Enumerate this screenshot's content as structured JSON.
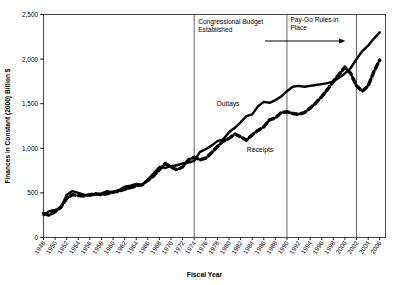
{
  "chart_data": {
    "type": "line",
    "title": "",
    "xlabel": "Fiscal Year",
    "ylabel": "Finances in Constant (2000) Billion $",
    "ylim": [
      0,
      2500
    ],
    "xlim": [
      1948,
      2007
    ],
    "yticks": [
      "0",
      "500",
      "1,000",
      "1,500",
      "2,000",
      "2,500"
    ],
    "ytick_values": [
      0,
      500,
      1000,
      1500,
      2000,
      2500
    ],
    "grid": false,
    "legend_position": "inline-labels",
    "xticks": [
      "1948",
      "1950",
      "1952",
      "1954",
      "1956",
      "1958",
      "1960",
      "1962",
      "1964",
      "1966",
      "1968",
      "1970",
      "1972",
      "1974",
      "1976",
      "1978",
      "1980",
      "1982",
      "1984",
      "1986",
      "1988",
      "1990",
      "1992",
      "1994",
      "1996",
      "1998",
      "2000",
      "2002",
      "2004",
      "2006"
    ],
    "xtick_values": [
      1948,
      1950,
      1952,
      1954,
      1956,
      1958,
      1960,
      1962,
      1964,
      1966,
      1968,
      1970,
      1972,
      1974,
      1976,
      1978,
      1980,
      1982,
      1984,
      1986,
      1988,
      1990,
      1992,
      1994,
      1996,
      1998,
      2000,
      2002,
      2004,
      2006
    ],
    "series": [
      {
        "name": "Outlays",
        "style": "solid",
        "color": "#000000",
        "x": [
          1948,
          1949,
          1950,
          1951,
          1952,
          1953,
          1954,
          1955,
          1956,
          1957,
          1958,
          1959,
          1960,
          1961,
          1962,
          1963,
          1964,
          1965,
          1966,
          1967,
          1968,
          1969,
          1970,
          1971,
          1972,
          1973,
          1974,
          1975,
          1976,
          1977,
          1978,
          1979,
          1980,
          1981,
          1982,
          1983,
          1984,
          1985,
          1986,
          1987,
          1988,
          1989,
          1990,
          1991,
          1992,
          1993,
          1994,
          1995,
          1996,
          1997,
          1998,
          1999,
          2000,
          2001,
          2002,
          2003,
          2004,
          2005,
          2006
        ],
        "values": [
          250,
          295,
          310,
          330,
          480,
          520,
          500,
          480,
          470,
          480,
          495,
          520,
          505,
          530,
          570,
          580,
          600,
          590,
          650,
          720,
          790,
          780,
          800,
          810,
          830,
          840,
          860,
          960,
          990,
          1030,
          1080,
          1100,
          1180,
          1230,
          1290,
          1360,
          1380,
          1470,
          1520,
          1510,
          1540,
          1580,
          1640,
          1690,
          1700,
          1690,
          1700,
          1710,
          1720,
          1730,
          1750,
          1790,
          1840,
          1900,
          2000,
          2090,
          2150,
          2230,
          2300
        ]
      },
      {
        "name": "Receipts",
        "style": "dashed",
        "color": "#000000",
        "x": [
          1948,
          1949,
          1950,
          1951,
          1952,
          1953,
          1954,
          1955,
          1956,
          1957,
          1958,
          1959,
          1960,
          1961,
          1962,
          1963,
          1964,
          1965,
          1966,
          1967,
          1968,
          1969,
          1970,
          1971,
          1972,
          1973,
          1974,
          1975,
          1976,
          1977,
          1978,
          1979,
          1980,
          1981,
          1982,
          1983,
          1984,
          1985,
          1986,
          1987,
          1988,
          1989,
          1990,
          1991,
          1992,
          1993,
          1994,
          1995,
          1996,
          1997,
          1998,
          1999,
          2000,
          2001,
          2002,
          2003,
          2004,
          2005,
          2006
        ],
        "values": [
          270,
          250,
          290,
          340,
          440,
          480,
          470,
          465,
          480,
          490,
          480,
          490,
          510,
          520,
          540,
          560,
          580,
          590,
          640,
          690,
          760,
          830,
          790,
          760,
          790,
          870,
          900,
          870,
          890,
          950,
          1020,
          1080,
          1110,
          1160,
          1130,
          1090,
          1150,
          1200,
          1240,
          1320,
          1340,
          1400,
          1410,
          1390,
          1380,
          1400,
          1450,
          1510,
          1580,
          1660,
          1750,
          1830,
          1910,
          1840,
          1700,
          1640,
          1700,
          1860,
          1990
        ]
      }
    ],
    "annotations": [
      {
        "name": "congressional-budget-established",
        "text": "Congressional Budget\nEstablished",
        "line1": "Congressional Budget",
        "line2": "Established",
        "marker_year": 1974,
        "type": "vertical-line-with-label"
      },
      {
        "name": "pay-go-rules-in-place",
        "text": "Pay-Go Rules in\nPlace",
        "line1": "Pay-Go Rules in",
        "line2": "Place",
        "marker_year": 1990,
        "arrow_from_year": 1990,
        "arrow_to_year": 2002,
        "type": "vertical-line-with-label-and-arrow"
      },
      {
        "name": "reference-line-2002",
        "marker_year": 2002,
        "type": "vertical-line"
      }
    ],
    "series_inline_labels": [
      {
        "name": "Outlays",
        "label": "Outlays"
      },
      {
        "name": "Receipts",
        "label": "Receipts"
      }
    ]
  }
}
